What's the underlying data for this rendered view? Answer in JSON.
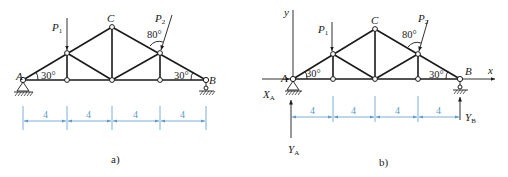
{
  "figures": [
    {
      "caption": "a)",
      "nodes": {
        "A": "A",
        "B": "B",
        "C": "C"
      },
      "loads": [
        {
          "name": "P1",
          "label": "P",
          "sub": "1"
        },
        {
          "name": "P2",
          "label": "P",
          "sub": "2",
          "angle_label": "80°"
        }
      ],
      "angles": {
        "left": "30°",
        "right": "30°"
      },
      "dimensions": [
        "4",
        "4",
        "4",
        "4"
      ]
    },
    {
      "caption": "b)",
      "nodes": {
        "A": "A",
        "B": "B",
        "C": "C"
      },
      "loads": [
        {
          "name": "P1",
          "label": "P",
          "sub": "1"
        },
        {
          "name": "P2",
          "label": "P",
          "sub": "2",
          "angle_label": "80°"
        }
      ],
      "angles": {
        "left": "30°",
        "right": "30°"
      },
      "dimensions": [
        "4",
        "4",
        "4",
        "4"
      ],
      "axes": {
        "x": "x",
        "y": "y"
      },
      "reactions": [
        {
          "name": "XA",
          "label": "X",
          "sub": "A"
        },
        {
          "name": "YA",
          "label": "Y",
          "sub": "A"
        },
        {
          "name": "YB",
          "label": "Y",
          "sub": "B"
        }
      ]
    }
  ]
}
